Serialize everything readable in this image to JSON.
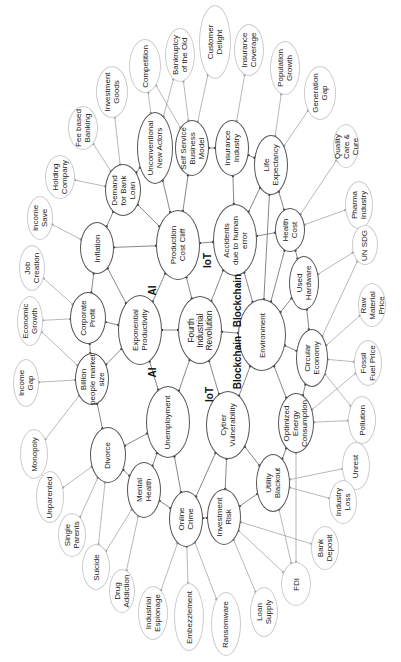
{
  "diagram": {
    "center": {
      "id": "fir",
      "label": "Fourth\nIndustrial\nRevolution",
      "x": 200,
      "y": 330,
      "rx": 22,
      "ry": 34
    },
    "inner": [
      {
        "id": "prod",
        "label": "Production\nCost Cliff",
        "x": 178,
        "y": 245,
        "rx": 22,
        "ry": 35
      },
      {
        "id": "acc",
        "label": "Accidents\ndue to human\nerror",
        "x": 235,
        "y": 240,
        "rx": 22,
        "ry": 36
      },
      {
        "id": "exp",
        "label": "Exponential\nProductivity",
        "x": 140,
        "y": 330,
        "rx": 22,
        "ry": 35
      },
      {
        "id": "env",
        "label": "Environment",
        "x": 262,
        "y": 335,
        "rx": 24,
        "ry": 36
      },
      {
        "id": "unemp",
        "label": "Unemployment",
        "x": 168,
        "y": 422,
        "rx": 22,
        "ry": 36
      },
      {
        "id": "cyber",
        "label": "Cyber\nVulnerability",
        "x": 228,
        "y": 425,
        "rx": 22,
        "ry": 34
      },
      {
        "id": "dbl",
        "label": "Demand\nfor Bank\nLoan",
        "x": 123,
        "y": 190,
        "rx": 18,
        "ry": 26
      },
      {
        "id": "una",
        "label": "Unconventional\nNew Actors",
        "x": 155,
        "y": 148,
        "rx": 18,
        "ry": 36
      },
      {
        "id": "ssbm",
        "label": "Self Service\nBusiness\nModel",
        "x": 192,
        "y": 148,
        "rx": 17,
        "ry": 28
      },
      {
        "id": "ins",
        "label": "Insurance\nIndustry",
        "x": 232,
        "y": 148,
        "rx": 17,
        "ry": 28
      },
      {
        "id": "life",
        "label": "Life\nExpectancy",
        "x": 271,
        "y": 165,
        "rx": 17,
        "ry": 30
      },
      {
        "id": "health",
        "label": "Health\nCost",
        "x": 290,
        "y": 230,
        "rx": 15,
        "ry": 22
      },
      {
        "id": "used",
        "label": "Used\nHardware",
        "x": 304,
        "y": 283,
        "rx": 15,
        "ry": 27
      },
      {
        "id": "circ",
        "label": "Circular\nEconomy",
        "x": 312,
        "y": 358,
        "rx": 16,
        "ry": 29
      },
      {
        "id": "opt",
        "label": "Optimized\nEnergy\nConsumption",
        "x": 296,
        "y": 423,
        "rx": 18,
        "ry": 30
      },
      {
        "id": "util",
        "label": "Utility\nBlackout",
        "x": 273,
        "y": 483,
        "rx": 17,
        "ry": 29
      },
      {
        "id": "inv",
        "label": "Investment\nRisk",
        "x": 224,
        "y": 517,
        "rx": 17,
        "ry": 28
      },
      {
        "id": "crime",
        "label": "Online\nCrime",
        "x": 186,
        "y": 519,
        "rx": 17,
        "ry": 28
      },
      {
        "id": "mental",
        "label": "Mental\nHealth",
        "x": 144,
        "y": 490,
        "rx": 17,
        "ry": 28
      },
      {
        "id": "divorce",
        "label": "Divorce",
        "x": 108,
        "y": 455,
        "rx": 18,
        "ry": 28
      },
      {
        "id": "billion",
        "label": "Billion\npeople market\nsize",
        "x": 92,
        "y": 379,
        "rx": 17,
        "ry": 26
      },
      {
        "id": "corp",
        "label": "Corporate\nProfit",
        "x": 88,
        "y": 318,
        "rx": 18,
        "ry": 26
      },
      {
        "id": "infl",
        "label": "Inflation",
        "x": 97,
        "y": 248,
        "rx": 17,
        "ry": 26
      }
    ],
    "outer": [
      {
        "id": "holding",
        "label": "Holding\nCompany",
        "x": 60,
        "y": 177,
        "rx": 15,
        "ry": 22
      },
      {
        "id": "fee",
        "label": "Fee based\nBanking",
        "x": 83,
        "y": 128,
        "rx": 15,
        "ry": 22
      },
      {
        "id": "invgoods",
        "label": "Investment\nGoods",
        "x": 112,
        "y": 92,
        "rx": 16,
        "ry": 26
      },
      {
        "id": "comp",
        "label": "Competition",
        "x": 145,
        "y": 66,
        "rx": 16,
        "ry": 27
      },
      {
        "id": "bank",
        "label": "Bankruptcy\nof the Old",
        "x": 180,
        "y": 55,
        "rx": 15,
        "ry": 27
      },
      {
        "id": "cust",
        "label": "Customer\nDelight",
        "x": 215,
        "y": 42,
        "rx": 16,
        "ry": 37
      },
      {
        "id": "inscov",
        "label": "Insurance\nCoverage",
        "x": 249,
        "y": 50,
        "rx": 15,
        "ry": 26
      },
      {
        "id": "pop",
        "label": "Population\nGrowth",
        "x": 285,
        "y": 68,
        "rx": 15,
        "ry": 27
      },
      {
        "id": "gen",
        "label": "Generation\nGap",
        "x": 320,
        "y": 93,
        "rx": 16,
        "ry": 27
      },
      {
        "id": "qual",
        "label": "Quality\nCare &\nCure",
        "x": 346,
        "y": 146,
        "rx": 13,
        "ry": 22
      },
      {
        "id": "pharma",
        "label": "Pharma\nIndustry",
        "x": 359,
        "y": 205,
        "rx": 14,
        "ry": 24
      },
      {
        "id": "unsdg",
        "label": "UN SDG",
        "x": 365,
        "y": 245,
        "rx": 13,
        "ry": 20
      },
      {
        "id": "raw",
        "label": "Raw\nMaterial\nPrice",
        "x": 372,
        "y": 305,
        "rx": 14,
        "ry": 22
      },
      {
        "id": "fossil",
        "label": "Fossil\nFuel Price",
        "x": 368,
        "y": 363,
        "rx": 14,
        "ry": 23
      },
      {
        "id": "poll",
        "label": "Pollution",
        "x": 362,
        "y": 420,
        "rx": 14,
        "ry": 24
      },
      {
        "id": "unrest",
        "label": "Unrest",
        "x": 356,
        "y": 466,
        "rx": 14,
        "ry": 24
      },
      {
        "id": "indloss",
        "label": "Industry\nLoss",
        "x": 343,
        "y": 502,
        "rx": 14,
        "ry": 22
      },
      {
        "id": "bankdep",
        "label": "Bank\nDeposit",
        "x": 325,
        "y": 548,
        "rx": 14,
        "ry": 22
      },
      {
        "id": "fdi",
        "label": "FDI",
        "x": 296,
        "y": 584,
        "rx": 15,
        "ry": 22
      },
      {
        "id": "loan",
        "label": "Loan\nSupply",
        "x": 264,
        "y": 612,
        "rx": 14,
        "ry": 25
      },
      {
        "id": "ransom",
        "label": "Ransomware",
        "x": 226,
        "y": 624,
        "rx": 15,
        "ry": 32
      },
      {
        "id": "embez",
        "label": "Embezzlement",
        "x": 189,
        "y": 617,
        "rx": 15,
        "ry": 34
      },
      {
        "id": "indesp",
        "label": "Industrial\nEspionage",
        "x": 153,
        "y": 613,
        "rx": 15,
        "ry": 27
      },
      {
        "id": "drug",
        "label": "Drug\nAddiction",
        "x": 122,
        "y": 591,
        "rx": 13,
        "ry": 22
      },
      {
        "id": "suicide",
        "label": "Suicide",
        "x": 96,
        "y": 567,
        "rx": 14,
        "ry": 23
      },
      {
        "id": "single",
        "label": "Single\nParents",
        "x": 72,
        "y": 535,
        "rx": 14,
        "ry": 22
      },
      {
        "id": "unpar",
        "label": "Unparented",
        "x": 50,
        "y": 497,
        "rx": 14,
        "ry": 26
      },
      {
        "id": "mono",
        "label": "Monopoly",
        "x": 34,
        "y": 454,
        "rx": 14,
        "ry": 25
      },
      {
        "id": "incgap",
        "label": "Income\nGap",
        "x": 26,
        "y": 383,
        "rx": 13,
        "ry": 24
      },
      {
        "id": "econ",
        "label": "Economic\nGrowth",
        "x": 30,
        "y": 321,
        "rx": 13,
        "ry": 25
      },
      {
        "id": "job",
        "label": "Job\nCreation",
        "x": 32,
        "y": 268,
        "rx": 13,
        "ry": 23
      },
      {
        "id": "incsave",
        "label": "Income\nSave",
        "x": 40,
        "y": 218,
        "rx": 13,
        "ry": 22
      }
    ],
    "tech_labels": [
      {
        "text": "AI",
        "x": 152,
        "y": 290
      },
      {
        "text": "IoT",
        "x": 207,
        "y": 260
      },
      {
        "text": "Blockchain",
        "x": 237,
        "y": 300
      },
      {
        "text": "AI",
        "x": 152,
        "y": 372
      },
      {
        "text": "IoT",
        "x": 209,
        "y": 394
      },
      {
        "text": "Blockchain",
        "x": 237,
        "y": 362
      }
    ],
    "edges": [
      [
        "prod",
        "fir"
      ],
      [
        "acc",
        "fir"
      ],
      [
        "exp",
        "fir"
      ],
      [
        "env",
        "fir"
      ],
      [
        "unemp",
        "fir"
      ],
      [
        "cyber",
        "fir"
      ],
      [
        "exp",
        "prod"
      ],
      [
        "exp",
        "unemp"
      ],
      [
        "acc",
        "env"
      ],
      [
        "cyber",
        "env"
      ],
      [
        "prod",
        "acc"
      ],
      [
        "dbl",
        "prod"
      ],
      [
        "una",
        "prod"
      ],
      [
        "ssbm",
        "prod"
      ],
      [
        "ins",
        "acc"
      ],
      [
        "life",
        "acc"
      ],
      [
        "life",
        "env"
      ],
      [
        "health",
        "acc"
      ],
      [
        "health",
        "env"
      ],
      [
        "used",
        "env"
      ],
      [
        "circ",
        "env"
      ],
      [
        "opt",
        "env"
      ],
      [
        "util",
        "cyber"
      ],
      [
        "inv",
        "cyber"
      ],
      [
        "crime",
        "cyber"
      ],
      [
        "crime",
        "unemp"
      ],
      [
        "mental",
        "unemp"
      ],
      [
        "divorce",
        "unemp"
      ],
      [
        "billion",
        "exp"
      ],
      [
        "corp",
        "exp"
      ],
      [
        "infl",
        "exp"
      ],
      [
        "infl",
        "prod"
      ],
      [
        "corp",
        "billion"
      ],
      [
        "infl",
        "corp"
      ],
      [
        "dbl",
        "infl"
      ],
      [
        "una",
        "dbl"
      ],
      [
        "ssbm",
        "ins"
      ],
      [
        "ins",
        "life"
      ],
      [
        "life",
        "health"
      ],
      [
        "health",
        "used"
      ],
      [
        "used",
        "circ"
      ],
      [
        "circ",
        "opt"
      ],
      [
        "opt",
        "util"
      ],
      [
        "util",
        "inv"
      ],
      [
        "inv",
        "crime"
      ],
      [
        "crime",
        "mental"
      ],
      [
        "mental",
        "divorce"
      ],
      [
        "billion",
        "divorce"
      ],
      [
        "holding",
        "dbl"
      ],
      [
        "fee",
        "dbl"
      ],
      [
        "invgoods",
        "dbl"
      ],
      [
        "comp",
        "una"
      ],
      [
        "comp",
        "ssbm"
      ],
      [
        "bank",
        "una"
      ],
      [
        "bank",
        "ssbm"
      ],
      [
        "cust",
        "ssbm"
      ],
      [
        "inscov",
        "ins"
      ],
      [
        "pop",
        "life"
      ],
      [
        "gen",
        "life"
      ],
      [
        "qual",
        "health"
      ],
      [
        "pharma",
        "health"
      ],
      [
        "unsdg",
        "used"
      ],
      [
        "unsdg",
        "circ"
      ],
      [
        "raw",
        "circ"
      ],
      [
        "fossil",
        "circ"
      ],
      [
        "fossil",
        "opt"
      ],
      [
        "poll",
        "circ"
      ],
      [
        "poll",
        "opt"
      ],
      [
        "unrest",
        "util"
      ],
      [
        "indloss",
        "util"
      ],
      [
        "bankdep",
        "inv"
      ],
      [
        "fdi",
        "util"
      ],
      [
        "fdi",
        "opt"
      ],
      [
        "fdi",
        "inv"
      ],
      [
        "loan",
        "inv"
      ],
      [
        "ransom",
        "crime"
      ],
      [
        "embez",
        "crime"
      ],
      [
        "indesp",
        "crime"
      ],
      [
        "drug",
        "mental"
      ],
      [
        "suicide",
        "mental"
      ],
      [
        "suicide",
        "divorce"
      ],
      [
        "single",
        "divorce"
      ],
      [
        "unpar",
        "divorce"
      ],
      [
        "mono",
        "billion"
      ],
      [
        "incgap",
        "billion"
      ],
      [
        "econ",
        "corp"
      ],
      [
        "econ",
        "billion"
      ],
      [
        "job",
        "corp"
      ],
      [
        "incsave",
        "infl"
      ]
    ]
  }
}
